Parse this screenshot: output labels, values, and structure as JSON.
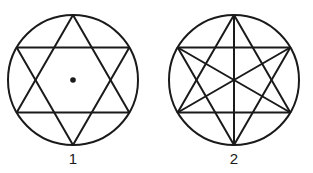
{
  "figures": [
    {
      "label": "1",
      "description": "Hexagram (two overlapping equilateral triangles) inscribed in a circle, with a dot at the center",
      "center": [
        73,
        80
      ],
      "radius": 65,
      "center_dot": true,
      "diagonals": false
    },
    {
      "label": "2",
      "description": "Hexagram inscribed in a circle with three diameters connecting opposite vertices through the center",
      "center": [
        234,
        80
      ],
      "radius": 65,
      "center_dot": false,
      "diagonals": true
    }
  ],
  "colors": {
    "line": "#1a1a1a",
    "background": "#ffffff"
  }
}
